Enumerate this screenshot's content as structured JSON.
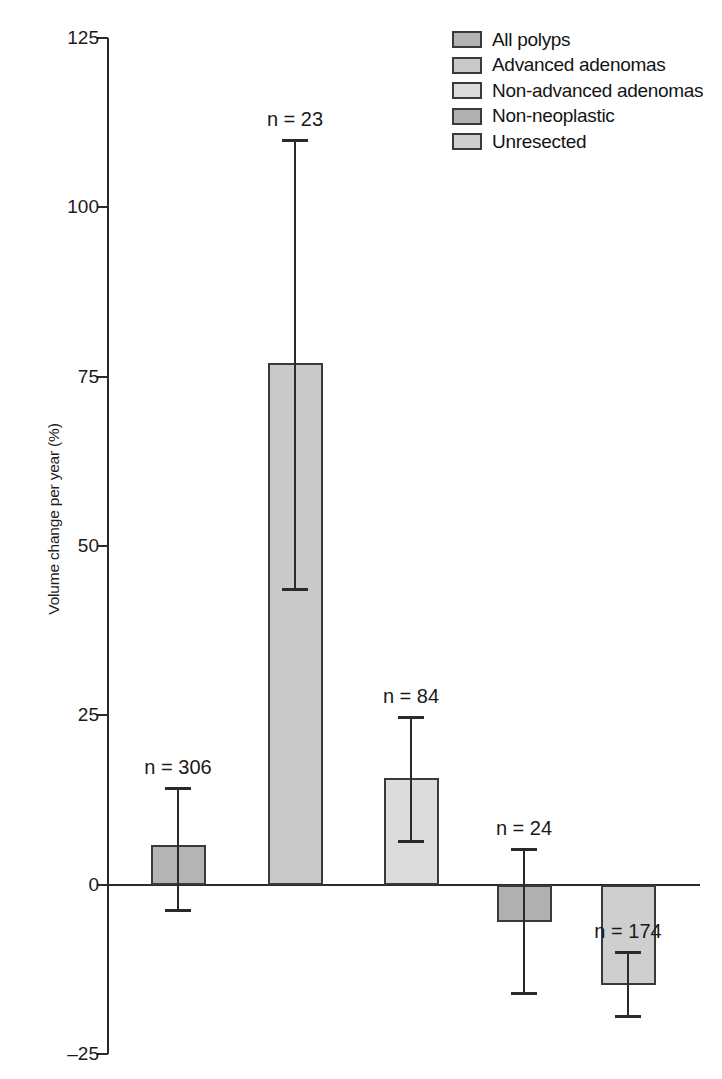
{
  "chart_data": {
    "type": "bar",
    "title": "",
    "xlabel": "",
    "ylabel": "Volume change per year (%)",
    "ylim": [
      -25,
      125
    ],
    "yticks": [
      125,
      100,
      75,
      50,
      25,
      0,
      -25
    ],
    "ytick_labels": [
      "125",
      "100",
      "75",
      "50",
      "25",
      "0",
      "–25"
    ],
    "grid": false,
    "legend_position": "top-right",
    "categories": [
      "All polyps",
      "Advanced adenomas",
      "Non-advanced adenomas",
      "Non-neoplastic",
      "Unresected"
    ],
    "values": [
      5.8,
      77.0,
      15.7,
      -5.5,
      -14.8
    ],
    "error_low": [
      -3.8,
      43.6,
      6.5,
      -16.0,
      -19.4
    ],
    "error_high": [
      14.2,
      110.0,
      24.8,
      5.3,
      -10.0
    ],
    "n_values": [
      306,
      23,
      84,
      24,
      174
    ],
    "annotations": [
      "n = 306",
      "n = 23",
      "n = 84",
      "n = 24",
      "n = 174"
    ],
    "bar_colors": [
      "#b4b4b4",
      "#c9c9c9",
      "#dcdcdc",
      "#b0b0b0",
      "#cfcfcf"
    ],
    "edge_color": "#3a3a3a",
    "axis_color": "#2a2a2a"
  },
  "legend": {
    "items": [
      {
        "label": "All polyps",
        "color": "#b4b4b4"
      },
      {
        "label": "Advanced adenomas",
        "color": "#c9c9c9"
      },
      {
        "label": "Non-advanced adenomas",
        "color": "#dcdcdc"
      },
      {
        "label": "Non-neoplastic",
        "color": "#b0b0b0"
      },
      {
        "label": "Unresected",
        "color": "#cfcfcf"
      }
    ]
  }
}
